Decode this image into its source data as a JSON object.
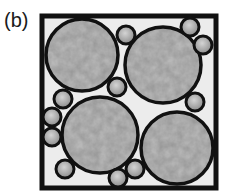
{
  "figure": {
    "label": "(b)",
    "square": {
      "x": 42,
      "y": 16,
      "width": 174,
      "height": 172,
      "stroke": "#111111",
      "stroke_width": 5,
      "fill": "#ececec"
    },
    "large_particles": [
      {
        "cx": 82,
        "cy": 55,
        "r": 36
      },
      {
        "cx": 163,
        "cy": 65,
        "r": 38
      },
      {
        "cx": 100,
        "cy": 135,
        "r": 38
      },
      {
        "cx": 177,
        "cy": 148,
        "r": 36
      }
    ],
    "small_particles": [
      {
        "cx": 126,
        "cy": 35,
        "r": 9
      },
      {
        "cx": 190,
        "cy": 27,
        "r": 9
      },
      {
        "cx": 203,
        "cy": 45,
        "r": 9
      },
      {
        "cx": 117,
        "cy": 87,
        "r": 9
      },
      {
        "cx": 63,
        "cy": 99,
        "r": 9
      },
      {
        "cx": 52,
        "cy": 117,
        "r": 9
      },
      {
        "cx": 52,
        "cy": 137,
        "r": 9
      },
      {
        "cx": 195,
        "cy": 102,
        "r": 9
      },
      {
        "cx": 65,
        "cy": 169,
        "r": 9
      },
      {
        "cx": 135,
        "cy": 169,
        "r": 9
      },
      {
        "cx": 118,
        "cy": 178,
        "r": 9
      }
    ],
    "colors": {
      "outline": "#111111",
      "particle_light": "#c8c8c8",
      "particle_mid": "#9a9a9a",
      "particle_dark": "#6a6a6a",
      "background": "#ececec"
    }
  }
}
